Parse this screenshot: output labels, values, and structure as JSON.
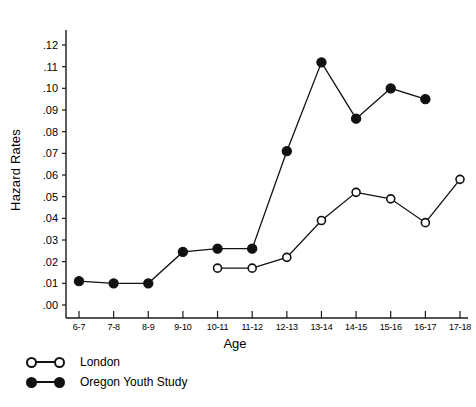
{
  "chart_data": {
    "type": "line",
    "title": "",
    "xlabel": "Age",
    "ylabel": "Hazard Rates",
    "categories": [
      "6-7",
      "7-8",
      "8-9",
      "9-10",
      "10-11",
      "11-12",
      "12-13",
      "13-14",
      "14-15",
      "15-16",
      "16-17",
      "17-18"
    ],
    "ylim": [
      0.0,
      0.125
    ],
    "xlim": [
      0,
      11
    ],
    "ytick_labels": [
      ".00",
      ".01",
      ".02",
      ".03",
      ".04",
      ".05",
      ".06",
      ".07",
      ".08",
      ".09",
      ".10",
      ".11",
      ".12"
    ],
    "ytick_values": [
      0.0,
      0.01,
      0.02,
      0.03,
      0.04,
      0.05,
      0.06,
      0.07,
      0.08,
      0.09,
      0.1,
      0.11,
      0.12
    ],
    "grid": false,
    "legend_position": "below-left",
    "series": [
      {
        "name": "London",
        "marker": "open-circle",
        "color": "#111111",
        "x": [
          "10-11",
          "11-12",
          "12-13",
          "13-14",
          "14-15",
          "15-16",
          "16-17",
          "17-18"
        ],
        "values": [
          0.017,
          0.017,
          0.022,
          0.039,
          0.052,
          0.049,
          0.038,
          0.058
        ]
      },
      {
        "name": "Oregon Youth Study",
        "marker": "filled-circle",
        "color": "#111111",
        "x": [
          "6-7",
          "7-8",
          "8-9",
          "9-10",
          "10-11",
          "11-12",
          "12-13",
          "13-14",
          "14-15",
          "15-16",
          "16-17"
        ],
        "values": [
          0.011,
          0.01,
          0.01,
          0.0245,
          0.026,
          0.026,
          0.071,
          0.112,
          0.086,
          0.1,
          0.095
        ]
      }
    ]
  },
  "legend": {
    "items": [
      {
        "label": "London",
        "style": "open"
      },
      {
        "label": "Oregon Youth Study",
        "style": "filled"
      }
    ]
  }
}
